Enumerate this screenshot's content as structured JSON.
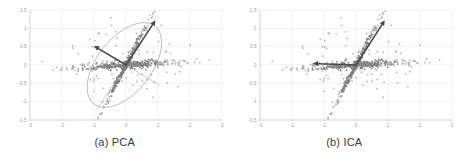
{
  "figure": {
    "panels": [
      {
        "id": "pca",
        "caption": "(a) PCA",
        "overlay": "ellipse-with-principal-axes"
      },
      {
        "id": "ica",
        "caption": "(b) ICA",
        "overlay": "independent-component-axes"
      }
    ]
  },
  "chart_data": [
    {
      "type": "scatter",
      "title": "(a) PCA",
      "xlabel": "",
      "ylabel": "",
      "xlim": [
        -3,
        3
      ],
      "ylim": [
        -1.5,
        1.5
      ],
      "xticks": [
        "-3",
        "-2",
        "-1",
        "0",
        "1",
        "2",
        "3"
      ],
      "yticks": [
        "1.5",
        "1",
        "0.5",
        "0",
        "-0.5",
        "-1",
        "-1.5"
      ],
      "grid": true,
      "legend": null,
      "point_color": "#858585",
      "annotations": [
        {
          "kind": "ellipse",
          "center": [
            -0.05,
            0.0
          ],
          "semi_major": 1.55,
          "semi_minor": 0.85,
          "rotation_deg": -52,
          "color": "#b4b4b4",
          "note": "gaussian confidence ellipse fitted to data"
        },
        {
          "kind": "arrow",
          "label": "first-principal-component",
          "from": [
            0.0,
            0.0
          ],
          "to": [
            0.92,
            1.22
          ],
          "color": "#4a4a4a"
        },
        {
          "kind": "arrow",
          "label": "second-principal-component",
          "from": [
            0.0,
            0.0
          ],
          "to": [
            -1.0,
            0.52
          ],
          "color": "#4a4a4a"
        },
        {
          "kind": "line",
          "label": "ellipse-minor-axis-guide",
          "from": [
            0.0,
            0.0
          ],
          "to": [
            1.05,
            -0.55
          ],
          "color": "#c0c0c0"
        },
        {
          "kind": "line",
          "label": "ellipse-major-axis-guide",
          "from": [
            0.0,
            0.0
          ],
          "to": [
            -0.9,
            -1.2
          ],
          "color": "#c0c0c0"
        }
      ],
      "series": [
        {
          "name": "mixed-signal-samples",
          "description": "two overlapping linear clusters: a near-horizontal band and a steep positive-slope band crossing at the origin",
          "n_points": 620
        }
      ]
    },
    {
      "type": "scatter",
      "title": "(b) ICA",
      "xlabel": "",
      "ylabel": "",
      "xlim": [
        -3,
        3
      ],
      "ylim": [
        -1.5,
        1.5
      ],
      "xticks": [
        "-3",
        "-2",
        "-1",
        "0",
        "1",
        "2",
        "3"
      ],
      "yticks": [
        "1.5",
        "1",
        "0.5",
        "0",
        "-0.5",
        "-1",
        "-1.5"
      ],
      "grid": true,
      "legend": null,
      "point_color": "#858585",
      "annotations": [
        {
          "kind": "arrow",
          "label": "first-independent-component",
          "from": [
            0.0,
            0.0
          ],
          "to": [
            0.9,
            1.22
          ],
          "color": "#4a4a4a"
        },
        {
          "kind": "arrow",
          "label": "second-independent-component",
          "from": [
            0.0,
            0.0
          ],
          "to": [
            -1.35,
            0.04
          ],
          "color": "#4a4a4a"
        }
      ],
      "series": [
        {
          "name": "mixed-signal-samples",
          "description": "two overlapping linear clusters: a near-horizontal band and a steep positive-slope band crossing at the origin",
          "n_points": 620
        }
      ]
    }
  ]
}
